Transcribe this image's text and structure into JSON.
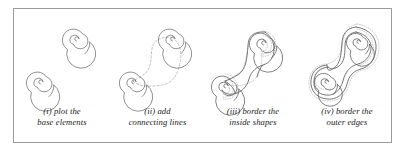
{
  "figure": {
    "kind": "four-step construction diagram",
    "frame_color": "#9b9b9b",
    "background_color": "#ffffff",
    "ink_color": "#555555",
    "guide_color": "#b8b8b8"
  },
  "panels": [
    {
      "id": "i",
      "label_line1": "(i) plot the",
      "label_line2": "base elements",
      "step_number": "(i)",
      "content": "two spiral volutes drawn as thin solid outlines, one upper-right and one lower-left",
      "stroke_style": "solid",
      "elements": [
        "spiral-upper",
        "spiral-lower"
      ]
    },
    {
      "id": "ii",
      "label_line1": "(ii) add",
      "label_line2": "connecting lines",
      "step_number": "(ii)",
      "content": "the two spirals joined by dashed S-curve connecting lines forming the band path",
      "stroke_style": "solid spirals with dashed connectors",
      "elements": [
        "spiral-upper",
        "spiral-lower",
        "connector-left",
        "connector-right"
      ]
    },
    {
      "id": "iii",
      "label_line1": "(iii) border the",
      "label_line2": "inside shapes",
      "step_number": "(iii)",
      "content": "solid S-shaped band outlines drawn around the inside shapes, dotted guides remain",
      "stroke_style": "solid band outline with dotted inner guides",
      "elements": [
        "band-outline",
        "spiral-upper",
        "spiral-lower",
        "dotted-guides"
      ]
    },
    {
      "id": "iv",
      "label_line1": "(iv) border the",
      "label_line2": "outer edges",
      "step_number": "(iv)",
      "content": "completed interlaced figure with outer edges bordered, dotted outer guide offset visible",
      "stroke_style": "solid multi-line outline with dotted outer offset",
      "elements": [
        "outer-border",
        "band-outline",
        "spiral-upper",
        "spiral-lower",
        "dotted-offset"
      ]
    }
  ]
}
